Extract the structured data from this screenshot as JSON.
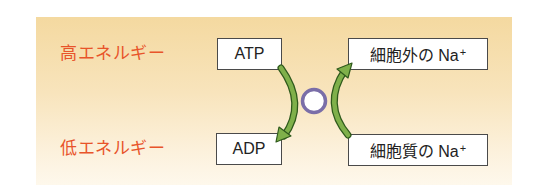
{
  "diagram": {
    "energy_labels": {
      "high": "高エネルギー",
      "low": "低エネルギー"
    },
    "left_boxes": {
      "top": "ATP",
      "bottom": "ADP"
    },
    "right_boxes": {
      "top_text": "細胞外の Na",
      "top_sup": "+",
      "bottom_text": "細胞質の Na",
      "bottom_sup": "+"
    },
    "arrows": [
      {
        "from": "ATP",
        "to": "ADP",
        "direction": "down"
      },
      {
        "from": "細胞質の Na+",
        "to": "細胞外の Na+",
        "direction": "up"
      }
    ],
    "center_symbol": "pump-circle",
    "colors": {
      "label_text": "#e8542a",
      "arrow_fill": "#7fb04a",
      "arrow_outline": "#2f5a1c",
      "circle_stroke": "#7a6ea8",
      "panel_top": "#f4d9a0",
      "panel_bottom": "#fef8ec"
    }
  }
}
